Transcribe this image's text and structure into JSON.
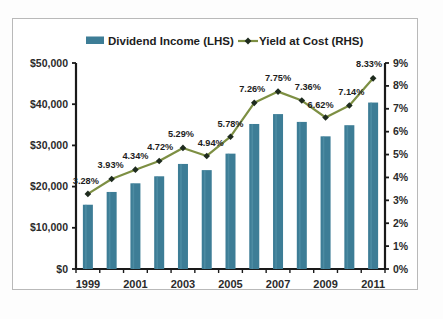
{
  "chart_data": {
    "type": "bar",
    "title": "",
    "subtitle": "",
    "xlabel": "",
    "ylabel": "",
    "grid": false,
    "legend_position": "top",
    "x": [
      1999,
      2000,
      2001,
      2002,
      2003,
      2004,
      2005,
      2006,
      2007,
      2008,
      2009,
      2010,
      2011
    ],
    "categories": [
      "1999",
      "2000",
      "2001",
      "2002",
      "2003",
      "2004",
      "2005",
      "2006",
      "2007",
      "2008",
      "2009",
      "2010",
      "2011"
    ],
    "x_tick_labels": [
      "1999",
      "",
      "2001",
      "",
      "2003",
      "",
      "2005",
      "",
      "2007",
      "",
      "2009",
      "",
      "2011"
    ],
    "left_axis": {
      "label": "",
      "ylim": [
        0,
        50000
      ],
      "ticks": [
        0,
        10000,
        20000,
        30000,
        40000,
        50000
      ],
      "tick_labels": [
        "$0",
        "$10,000",
        "$20,000",
        "$30,000",
        "$40,000",
        "$50,000"
      ]
    },
    "right_axis": {
      "label": "",
      "ylim": [
        0,
        9
      ],
      "ticks": [
        0,
        1,
        2,
        3,
        4,
        5,
        6,
        7,
        8,
        9
      ],
      "tick_labels": [
        "0%",
        "1%",
        "2%",
        "3%",
        "4%",
        "5%",
        "6%",
        "7%",
        "8%",
        "9%"
      ]
    },
    "series": [
      {
        "name": "Dividend Income (LHS)",
        "type": "bar",
        "axis": "left",
        "color": "#3d7d96",
        "values": [
          15600,
          18700,
          20800,
          22500,
          25500,
          24000,
          28000,
          35200,
          37600,
          35700,
          32200,
          34900,
          40400
        ]
      },
      {
        "name": "Yield at Cost (RHS)",
        "type": "line",
        "axis": "right",
        "color": "#7d8f43",
        "marker_color": "#1e2b1e",
        "values": [
          3.28,
          3.93,
          4.34,
          4.72,
          5.29,
          4.94,
          5.78,
          7.26,
          7.75,
          7.36,
          6.62,
          7.14,
          8.33
        ],
        "data_labels": [
          "3.28%",
          "3.93%",
          "4.34%",
          "4.72%",
          "5.29%",
          "4.94%",
          "5.78%",
          "7.26%",
          "7.75%",
          "7.36%",
          "6.62%",
          "7.14%",
          "8.33%"
        ]
      }
    ],
    "legend": [
      {
        "label": "Dividend Income (LHS)",
        "marker": "bar-swatch",
        "color": "#3d7d96"
      },
      {
        "label": "Yield at Cost (RHS)",
        "marker": "line-diamond",
        "color": "#7d8f43"
      }
    ]
  },
  "colors": {
    "bar": "#3d7d96",
    "line": "#7d8f43",
    "marker": "#1e2b1e",
    "axis": "#1a1a1a",
    "frame": "#b9b9b9",
    "text": "#1d1d1d",
    "background": "#ffffff"
  }
}
